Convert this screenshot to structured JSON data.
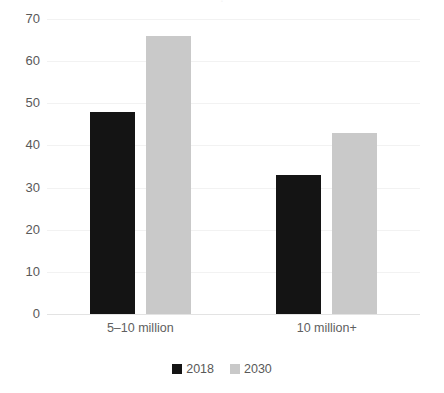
{
  "chart_data": {
    "type": "bar",
    "title": "",
    "xlabel": "",
    "ylabel": "",
    "categories": [
      "5–10 million",
      "10 million+"
    ],
    "series": [
      {
        "name": "2018",
        "values": [
          48,
          33
        ],
        "color": "#141414"
      },
      {
        "name": "2030",
        "values": [
          66,
          43
        ],
        "color": "#c9c9c9"
      }
    ],
    "ylim": [
      0,
      70
    ],
    "ytick_values": [
      0,
      10,
      20,
      30,
      40,
      50,
      60,
      70
    ],
    "ytick_labels": [
      "0",
      "10",
      "20",
      "30",
      "40",
      "50",
      "60",
      "70"
    ],
    "grid": true,
    "grid_axis": "y",
    "legend_position": "bottom",
    "annotations": []
  },
  "axis": {
    "y_labels": [
      "70",
      "60",
      "50",
      "40",
      "30",
      "20",
      "10",
      "0"
    ]
  },
  "categories": {
    "group_1": "5–10 million",
    "group_2": "10 million+"
  },
  "legend": {
    "entries": [
      {
        "label": "2018",
        "color": "#141414",
        "icon": "square-swatch"
      },
      {
        "label": "2030",
        "color": "#c9c9c9",
        "icon": "square-swatch"
      }
    ]
  },
  "title_remnant": "."
}
